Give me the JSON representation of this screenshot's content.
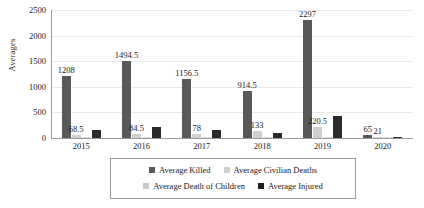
{
  "chart_data": {
    "type": "bar",
    "title": "",
    "xlabel": "",
    "ylabel": "Averages",
    "ylim": [
      0,
      2500
    ],
    "yticks": [
      "0",
      "500",
      "1000",
      "1500",
      "2000",
      "2500"
    ],
    "grid": true,
    "legend_position": "bottom",
    "categories": [
      "2015",
      "2016",
      "2017",
      "2018",
      "2019",
      "2020"
    ],
    "series": [
      {
        "name": "Average Killed",
        "color": "#595959",
        "values": [
          1208,
          1494.5,
          1156.5,
          914.5,
          2297,
          65
        ],
        "labels": [
          "1208",
          "1494.5",
          "1156.5",
          "914.5",
          "2297",
          "65"
        ]
      },
      {
        "name": "Average Civilian Deaths",
        "color": "#d0d0d0",
        "values": [
          68.5,
          84.5,
          78,
          133,
          220.5,
          21
        ],
        "labels": [
          "68.5",
          "84.5",
          "78",
          "133",
          "220.5",
          "21"
        ]
      },
      {
        "name": "Average Death of Children",
        "color": "#e2e2e2",
        "values": [
          12,
          16,
          10,
          14,
          18,
          4
        ],
        "labels": [
          "",
          "",
          "",
          "",
          "",
          ""
        ]
      },
      {
        "name": "Average Injured",
        "color": "#2b2b2b",
        "values": [
          160,
          210,
          150,
          90,
          430,
          6
        ],
        "labels": [
          "",
          "",
          "",
          "",
          "",
          ""
        ]
      }
    ]
  },
  "legend": {
    "rows": [
      [
        {
          "label": "Average Killed",
          "swatch": "s0"
        },
        {
          "label": "Average Civilian Deaths",
          "swatch": "s1"
        }
      ],
      [
        {
          "label": "Average Death of Children",
          "swatch": "s2"
        },
        {
          "label": "Average Injured",
          "swatch": "s3"
        }
      ]
    ]
  }
}
